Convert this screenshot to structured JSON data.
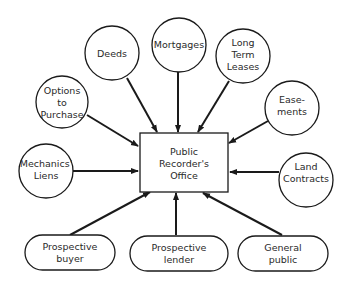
{
  "center": {
    "lines": [
      "Public",
      "Recorder's",
      "Office"
    ]
  },
  "sources": [
    {
      "id": "deeds",
      "lines": [
        "Deeds"
      ]
    },
    {
      "id": "mortgages",
      "lines": [
        "Mortgages"
      ]
    },
    {
      "id": "long-term-leases",
      "lines": [
        "Long",
        "Term",
        "Leases"
      ]
    },
    {
      "id": "easements",
      "lines": [
        "Ease-",
        "ments"
      ]
    },
    {
      "id": "options-to-purchase",
      "lines": [
        "Options",
        "to",
        "Purchase"
      ]
    },
    {
      "id": "mechanics-liens",
      "lines": [
        "Mechanics'",
        "Liens"
      ]
    },
    {
      "id": "land-contracts",
      "lines": [
        "Land",
        "Contracts"
      ]
    }
  ],
  "users": [
    {
      "id": "prospective-buyer",
      "lines": [
        "Prospective",
        "buyer"
      ]
    },
    {
      "id": "prospective-lender",
      "lines": [
        "Prospective",
        "lender"
      ]
    },
    {
      "id": "general-public",
      "lines": [
        "General",
        "public"
      ]
    }
  ],
  "colors": {
    "stroke": "#1a1a1a",
    "background": "#ffffff"
  }
}
